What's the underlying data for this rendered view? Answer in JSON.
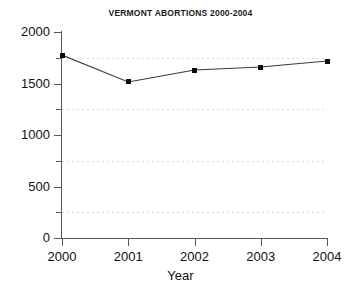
{
  "chart_data": {
    "type": "line",
    "title": "VERMONT ABORTIONS 2000-2004",
    "xlabel": "Year",
    "ylabel": "",
    "categories": [
      "2000",
      "2001",
      "2002",
      "2003",
      "2004"
    ],
    "x": [
      2000,
      2001,
      2002,
      2003,
      2004
    ],
    "values": [
      1776,
      1515,
      1631,
      1660,
      1718
    ],
    "series": [
      {
        "name": "Vermont abortions",
        "values": [
          1776,
          1515,
          1631,
          1660,
          1718
        ],
        "line_color": "#3a3a3a",
        "marker_color": "#0b0b0b",
        "marker": "square"
      }
    ],
    "ylim": [
      0,
      2000
    ],
    "xlim": [
      2000,
      2004
    ],
    "y_ticks": [
      0,
      500,
      1000,
      1500,
      2000
    ],
    "y_tick_labels": [
      "0",
      "500",
      "1000",
      "1500",
      "2000"
    ],
    "y_minor_ticks": [
      250,
      750,
      1250,
      1750
    ],
    "x_ticks": [
      2000,
      2001,
      2002,
      2003,
      2004
    ],
    "x_tick_labels": [
      "2000",
      "2001",
      "2002",
      "2003",
      "2004"
    ],
    "grid": true,
    "grid_at": [
      250,
      750,
      1250,
      1750
    ],
    "grid_style": "dotted",
    "grid_color": "#d8d8d8",
    "legend": false,
    "legend_position": "none",
    "background": "#ffffff",
    "axis_color": "#565656"
  }
}
